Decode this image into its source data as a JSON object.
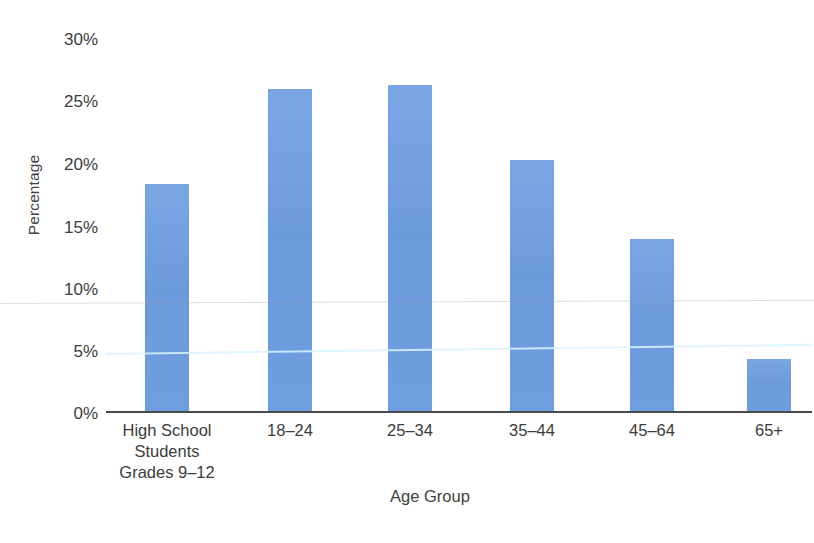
{
  "chart_data": {
    "type": "bar",
    "title": "",
    "xlabel": "Age Group",
    "ylabel": "Percentage",
    "categories": [
      "High School\nStudents\nGrades 9–12",
      "18–24",
      "25–34",
      "35–44",
      "45–64",
      "65+"
    ],
    "category_lines": [
      [
        "High School",
        "Students",
        "Grades 9–12"
      ],
      [
        "18–24"
      ],
      [
        "25–34"
      ],
      [
        "35–44"
      ],
      [
        "45–64"
      ],
      [
        "65+"
      ]
    ],
    "values": [
      17.9,
      25.4,
      25.7,
      19.8,
      13.6,
      4.2
    ],
    "ylim": [
      0,
      30
    ],
    "ytick_values": [
      0,
      5,
      10,
      15,
      20,
      25,
      30
    ],
    "ytick_labels": [
      "0%",
      "5%",
      "10%",
      "15%",
      "20%",
      "25%",
      "30%"
    ],
    "grid": false,
    "legend": null,
    "bar_color": "#6f9ee0",
    "axis_color": "#4a4a4a",
    "text_color": "#3c3c3c"
  }
}
